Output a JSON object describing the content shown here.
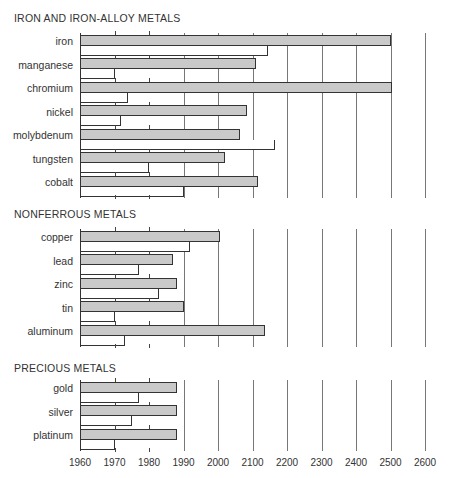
{
  "chart_data": {
    "type": "bar",
    "orientation": "horizontal",
    "title": "",
    "xlabel": "",
    "ylabel": "",
    "x_ticks": [
      1960,
      1970,
      1980,
      1990,
      2000,
      2100,
      2200,
      2300,
      2400,
      2500,
      2600
    ],
    "x_tick_labels": [
      "1960",
      "1970",
      "1980",
      "1990",
      "2000",
      "2100",
      "2200",
      "2300",
      "2400",
      "2500",
      "2600"
    ],
    "x_scale_note": "non-linear axis: 10-year steps from 1960 to 2000, then 100-year steps to 2600",
    "xlim": [
      1960,
      2600
    ],
    "grid": true,
    "legend": [],
    "series": [
      {
        "name": "grey bar (upper)",
        "fill": "#c9c9c9"
      },
      {
        "name": "white bar (lower)",
        "fill": "#ffffff"
      }
    ],
    "groups": [
      {
        "title": "IRON AND IRON-ALLOY METALS",
        "items": [
          {
            "label": "iron",
            "grey": 2500,
            "white": 2145
          },
          {
            "label": "manganese",
            "grey": 2110,
            "white": 1970
          },
          {
            "label": "chromium",
            "grey": 2505,
            "white": 1974
          },
          {
            "label": "nickel",
            "grey": 2085,
            "white": 1972
          },
          {
            "label": "molybdenum",
            "grey": 2065,
            "white": 2165
          },
          {
            "label": "tungsten",
            "grey": 2020,
            "white": 1980
          },
          {
            "label": "cobalt",
            "grey": 2115,
            "white": 1990
          }
        ]
      },
      {
        "title": "NONFERROUS METALS",
        "items": [
          {
            "label": "copper",
            "grey": 2005,
            "white": 1992
          },
          {
            "label": "lead",
            "grey": 1987,
            "white": 1977
          },
          {
            "label": "zinc",
            "grey": 1988,
            "white": 1983
          },
          {
            "label": "tin",
            "grey": 1990,
            "white": 1970
          },
          {
            "label": "aluminum",
            "grey": 2135,
            "white": 1973
          }
        ]
      },
      {
        "title": "PRECIOUS METALS",
        "items": [
          {
            "label": "gold",
            "grey": 1988,
            "white": 1977
          },
          {
            "label": "silver",
            "grey": 1988,
            "white": 1975
          },
          {
            "label": "platinum",
            "grey": 1988,
            "white": 1970
          }
        ]
      }
    ]
  },
  "layout": {
    "sections": [
      {
        "title_y": 12,
        "top": 33,
        "row_h": 23.5
      },
      {
        "title_y": 208,
        "top": 229,
        "row_h": 23.5
      },
      {
        "title_y": 362,
        "top": 380,
        "row_h": 23.5
      }
    ],
    "origin_x": 80,
    "step_px": 34.5
  }
}
